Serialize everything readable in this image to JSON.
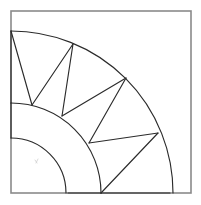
{
  "figure": {
    "canvas": {
      "width": 201,
      "height": 205,
      "background": "#ffffff"
    },
    "frame": {
      "name": "bounding-square",
      "x": 11,
      "y": 11,
      "width": 180,
      "height": 182,
      "stroke": "#8a8a8a",
      "stroke_width": 1.6
    },
    "arc_center": {
      "x": 11,
      "y": 193
    },
    "stroke_color": "#2b2b2b",
    "stroke_width": 1.15,
    "arcs": [
      {
        "name": "outer-arc",
        "radius": 162,
        "start_angle_deg": 0,
        "end_angle_deg": 90,
        "label": "outer boundary arc"
      },
      {
        "name": "middle-arc",
        "radius": 90,
        "start_angle_deg": 0,
        "end_angle_deg": 90,
        "label": "middle arc"
      },
      {
        "name": "inner-arc",
        "radius": 55,
        "start_angle_deg": 0,
        "end_angle_deg": 90,
        "label": "inner arc"
      }
    ],
    "outer_vertices": [
      {
        "name": "outer-v0",
        "x": 11,
        "y": 31,
        "angle_deg": 90.0
      },
      {
        "name": "outer-v1",
        "x": 73,
        "y": 44,
        "angle_deg": 67.4
      },
      {
        "name": "outer-v2",
        "x": 126,
        "y": 78,
        "angle_deg": 45.8
      },
      {
        "name": "outer-v3",
        "x": 158,
        "y": 133,
        "angle_deg": 22.0
      },
      {
        "name": "outer-v4",
        "x": 170,
        "y": 193,
        "angle_deg": 0.0
      }
    ],
    "middle_vertices": [
      {
        "name": "middle-v0",
        "x": 11,
        "y": 103,
        "angle_deg": 90.0
      },
      {
        "name": "middle-v1",
        "x": 32,
        "y": 105,
        "angle_deg": 76.5
      },
      {
        "name": "middle-v2",
        "x": 62,
        "y": 116,
        "angle_deg": 57.6
      },
      {
        "name": "middle-v3",
        "x": 89,
        "y": 143,
        "angle_deg": 34.0
      },
      {
        "name": "middle-v4",
        "x": 101,
        "y": 193,
        "angle_deg": 0.0
      }
    ],
    "inner_vertices": [
      {
        "name": "inner-v0",
        "x": 11,
        "y": 138,
        "angle_deg": 90.0
      },
      {
        "name": "inner-v1",
        "x": 68,
        "y": 193,
        "angle_deg": 0.0
      }
    ],
    "radial_edges": [
      {
        "name": "radial-edge-left",
        "from": "outer-v0",
        "to": "middle-v0",
        "x1": 11,
        "y1": 31,
        "x2": 11,
        "y2": 103
      },
      {
        "name": "radial-edge-bottom",
        "from": "outer-v4",
        "to": "middle-v4",
        "x1": 170,
        "y1": 193,
        "x2": 101,
        "y2": 193
      },
      {
        "name": "spoke-edge-inner-left",
        "from": "middle-v0",
        "to": "inner-v0",
        "x1": 11,
        "y1": 103,
        "x2": 11,
        "y2": 138
      },
      {
        "name": "spoke-edge-inner-bottom",
        "from": "middle-v4",
        "to": "inner-v1",
        "x1": 101,
        "y1": 193,
        "x2": 68,
        "y2": 193
      }
    ],
    "triangulation_chords": [
      {
        "name": "chord-o0-m1",
        "x1": 11,
        "y1": 31,
        "x2": 32,
        "y2": 105
      },
      {
        "name": "chord-o1-m1",
        "x1": 73,
        "y1": 44,
        "x2": 32,
        "y2": 105
      },
      {
        "name": "chord-o1-m2",
        "x1": 73,
        "y1": 44,
        "x2": 62,
        "y2": 116
      },
      {
        "name": "chord-o2-m2",
        "x1": 126,
        "y1": 78,
        "x2": 62,
        "y2": 116
      },
      {
        "name": "chord-o2-m3",
        "x1": 126,
        "y1": 78,
        "x2": 89,
        "y2": 143
      },
      {
        "name": "chord-o3-m3",
        "x1": 158,
        "y1": 133,
        "x2": 89,
        "y2": 143
      },
      {
        "name": "chord-o3-m4",
        "x1": 158,
        "y1": 133,
        "x2": 101,
        "y2": 193
      },
      {
        "name": "chord-o4-m4",
        "x1": 170,
        "y1": 193,
        "x2": 101,
        "y2": 193
      }
    ],
    "counts": {
      "arc_count": 3,
      "triangle_count": 8,
      "outer_vertex_count": 5,
      "middle_vertex_count": 5
    }
  }
}
